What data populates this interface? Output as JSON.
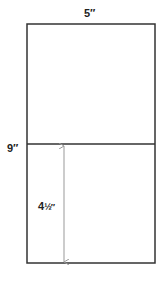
{
  "diagram": {
    "labels": {
      "width": "5″",
      "height": "9″",
      "half_height": "4",
      "half_height_fraction": "½″"
    },
    "colors": {
      "outline": "#333333",
      "arrow": "#999999",
      "text": "#222222",
      "background": "#ffffff"
    },
    "shapes": {
      "outer_rectangle": {
        "x": 27,
        "y": 24,
        "width": 128,
        "height": 239
      },
      "divider_line": {
        "y": 144
      },
      "dimension_arrow": {
        "x": 64,
        "y1": 145,
        "y2": 263
      }
    }
  }
}
